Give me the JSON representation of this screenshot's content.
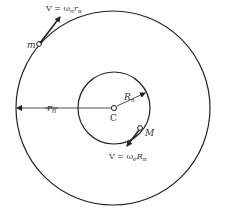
{
  "diagram": {
    "center_label": "C",
    "outer_circle": {
      "radius_label_main": "r",
      "radius_label_sub": "n"
    },
    "inner_circle": {
      "radius_label_main": "R",
      "radius_label_sub": "n"
    },
    "small_mass": {
      "label": "m",
      "velocity_label": {
        "prefix": "V = ω",
        "omega_sub": "n",
        "var": "r",
        "var_sub": "n"
      }
    },
    "large_mass": {
      "label": "M",
      "velocity_label": {
        "prefix": "V = ω",
        "omega_sub": "e",
        "var": "R",
        "var_sub": "n"
      }
    },
    "colors": {
      "stroke": "#222222",
      "text": "#333333",
      "background": "#ffffff"
    }
  }
}
